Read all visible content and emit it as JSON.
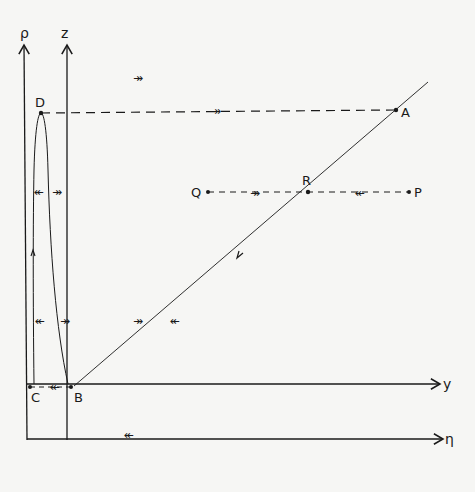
{
  "diagram": {
    "axes": {
      "rho": "ρ",
      "z": "z",
      "y": "y",
      "eta": "η"
    },
    "points": {
      "A": "A",
      "B": "B",
      "C": "C",
      "D": "D",
      "P": "P",
      "Q": "Q",
      "R": "R"
    },
    "flow_arrows": {
      "top_right": "↠",
      "dashed_DA": "↠",
      "QR": "↠",
      "PR": "↞",
      "loop_left": "↞",
      "loop_right": "↠",
      "mid_left": "↞",
      "mid_right": "↠",
      "diag_right": "↠",
      "diag_left": "↞",
      "CB": "↞",
      "bottom": "↞"
    },
    "colors": {
      "ink": "#1a1a1a",
      "paper": "#f6f6f4"
    }
  }
}
